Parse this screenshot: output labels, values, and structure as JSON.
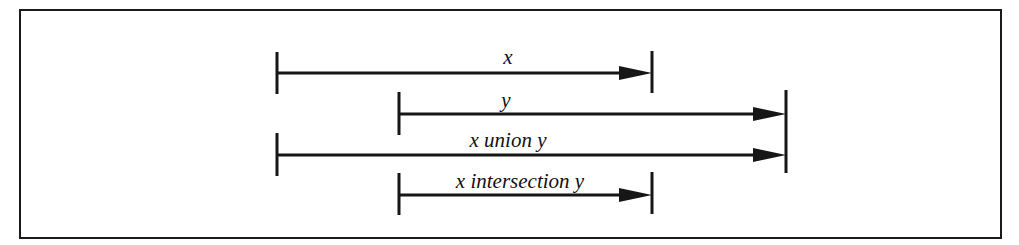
{
  "diagram": {
    "type": "interval-operations",
    "frame": {
      "x": 20,
      "y": 10,
      "width": 981,
      "height": 228,
      "stroke": "#1a1a1a"
    },
    "colors": {
      "line": "#161616",
      "text": "#111111",
      "background": "#ffffff"
    },
    "intervals": [
      {
        "id": "x",
        "label": "x",
        "start_x": 277,
        "end_x": 652,
        "line_y": 73,
        "label_x": 508,
        "label_y": 64
      },
      {
        "id": "y",
        "label": "y",
        "start_x": 399,
        "end_x": 786,
        "line_y": 114,
        "label_x": 506,
        "label_y": 107
      },
      {
        "id": "x-union-y",
        "label": "x union y",
        "start_x": 277,
        "end_x": 786,
        "line_y": 155,
        "label_x": 508,
        "label_y": 147
      },
      {
        "id": "x-intersection-y",
        "label": "x intersection y",
        "start_x": 399,
        "end_x": 652,
        "line_y": 195,
        "label_x": 520,
        "label_y": 188
      }
    ],
    "ticks": [
      {
        "id": "x-start",
        "x": 277,
        "y1": 52,
        "y2": 94
      },
      {
        "id": "x-end",
        "x": 652,
        "y1": 51,
        "y2": 93
      },
      {
        "id": "y-start",
        "x": 399,
        "y1": 92,
        "y2": 135
      },
      {
        "id": "union-start",
        "x": 277,
        "y1": 133,
        "y2": 176
      },
      {
        "id": "y-union-end",
        "x": 786,
        "y1": 90,
        "y2": 173
      },
      {
        "id": "intersection-start",
        "x": 399,
        "y1": 173,
        "y2": 215
      },
      {
        "id": "intersection-end",
        "x": 652,
        "y1": 172,
        "y2": 214
      }
    ],
    "arrowhead": {
      "length": 33,
      "half_height": 7
    }
  }
}
